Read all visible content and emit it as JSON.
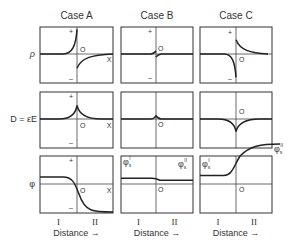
{
  "figure": {
    "columns": [
      {
        "id": "A",
        "title": "Case A"
      },
      {
        "id": "B",
        "title": "Case B"
      },
      {
        "id": "C",
        "title": "Case C"
      }
    ],
    "rows": [
      {
        "id": "rho",
        "label": "ρ"
      },
      {
        "id": "D",
        "label": "D = εE"
      },
      {
        "id": "phi",
        "label": "φ"
      }
    ],
    "axis_marks": {
      "plus": "+",
      "minus": "–",
      "origin": "O",
      "x": "X"
    },
    "regions": {
      "left": "I",
      "right": "II"
    },
    "xlabel": "Distance →",
    "phi_labels": {
      "left_main": "φ",
      "left_sub": "s",
      "left_sup": "I",
      "right_main": "φ",
      "right_sub": "s",
      "right_sup": "II"
    },
    "colors": {
      "ink": "#222222",
      "background": "#ffffff"
    }
  },
  "chart_data": {
    "type": "line",
    "title": "",
    "panels": [
      {
        "case": "A",
        "quantity": "rho",
        "description": "positive charge rising sharply to boundary on left, negative charge decaying from boundary on right",
        "left": {
          "sign": 1,
          "peak": 0.95
        },
        "right": {
          "sign": -1,
          "peak": 0.55
        }
      },
      {
        "case": "B",
        "quantity": "rho",
        "description": "small positive/negative spike near boundary",
        "left": {
          "sign": 1,
          "peak": 0.12
        },
        "right": {
          "sign": -1,
          "peak": 0.12
        }
      },
      {
        "case": "C",
        "quantity": "rho",
        "description": "negative charge on left, positive on right",
        "left": {
          "sign": -1,
          "peak": 0.9
        },
        "right": {
          "sign": 1,
          "peak": 0.55
        }
      },
      {
        "case": "A",
        "quantity": "D",
        "description": "positive cusp at boundary",
        "peak": 0.7
      },
      {
        "case": "B",
        "quantity": "D",
        "description": "small positive cusp at boundary",
        "peak": 0.12
      },
      {
        "case": "C",
        "quantity": "D",
        "description": "negative cusp at boundary",
        "peak": -0.65
      },
      {
        "case": "A",
        "quantity": "phi",
        "description": "potential falls from high in I to low in II",
        "left_level": 0.45,
        "right_level": -1.0
      },
      {
        "case": "B",
        "quantity": "phi",
        "description": "nearly flat, small step down",
        "left_level": 0.2,
        "right_level": 0.13
      },
      {
        "case": "C",
        "quantity": "phi",
        "description": "potential rises from I to II",
        "left_level": 0.25,
        "right_level": 1.15
      }
    ],
    "xlabel": "Distance",
    "ylabel_rows": [
      "ρ",
      "D = εE",
      "φ"
    ]
  }
}
